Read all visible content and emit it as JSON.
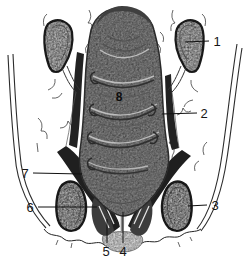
{
  "figure": {
    "callouts": {
      "c1": "1",
      "c2": "2",
      "c3": "3",
      "c4": "4",
      "c5": "5",
      "c6": "6",
      "c7": "7",
      "c8": "8"
    },
    "colors": {
      "background": "#ffffff",
      "ink": "#161616",
      "muscle_dark": "#1f1f1f",
      "rectum_gray": "#7d7d7d",
      "bone_gray": "#aeaeae",
      "skin_light": "#cfcfcf"
    }
  }
}
